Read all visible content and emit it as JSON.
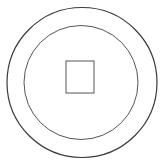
{
  "drawing": {
    "subject": "coin-outline",
    "stroke_color": "#3a3a3a",
    "background": "#ffffff",
    "outer_circle": {
      "cx": 82,
      "cy": 82.5,
      "r": 75
    },
    "inner_circle": {
      "cx": 81,
      "cy": 82.5,
      "r": 57
    },
    "center_square": {
      "x": 66,
      "y": 61,
      "width": 28,
      "height": 32
    }
  }
}
